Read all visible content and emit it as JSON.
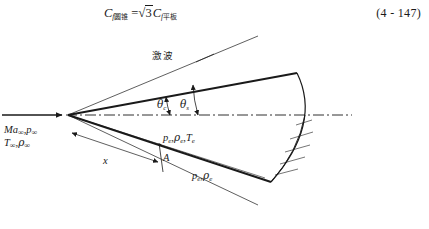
{
  "equation": {
    "lhs_symbol": "C",
    "lhs_sub_italic": "f",
    "lhs_sub_cjk": "圆锥",
    "equals": "=",
    "radical_sign": "√",
    "radicand": "3",
    "rhs_symbol": "C",
    "rhs_sub_italic": "f",
    "rhs_sub_cjk": "平板",
    "number": "(4 - 147)"
  },
  "diagram": {
    "shock_label": "激波",
    "angle_cone": {
      "symbol": "θ",
      "sub": "c"
    },
    "angle_shock": {
      "symbol": "θ",
      "sub": "s"
    },
    "freestream_line1": {
      "mach": "Ma",
      "mach_sub": "∞",
      "pressure": "p",
      "pressure_sub": "∞"
    },
    "freestream_line2": {
      "temperature": "T",
      "temperature_sub": "∞",
      "density": "ρ",
      "density_sub": "∞"
    },
    "edge_upper": {
      "pressure": "p",
      "pressure_sub": "e",
      "density": "ρ",
      "density_sub": "e",
      "temperature": "T",
      "temperature_sub": "e"
    },
    "edge_lower": {
      "pressure": "p",
      "pressure_sub": "e",
      "density": "ρ",
      "density_sub": "e"
    },
    "distance_label": "x",
    "point_label": "A",
    "colors": {
      "ink": "#1a1a1a",
      "background": "#ffffff"
    }
  }
}
